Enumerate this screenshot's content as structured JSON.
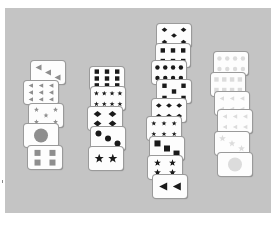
{
  "scene": {
    "description": "Stacks of picture cards with shapes arranged in four columns on a gray surface",
    "background_color": "#c4c4c4"
  },
  "colors": {
    "gray": "#8e8e8e",
    "black": "#1a1a1a",
    "light": "#dcdcdc"
  },
  "columns": [
    {
      "name": "gray-column",
      "cards": [
        {
          "shape": "triangle",
          "count": 3,
          "color": "gray",
          "x": 31,
          "y": 61
        },
        {
          "shape": "triangle",
          "count": 9,
          "color": "gray",
          "x": 24,
          "y": 81
        },
        {
          "shape": "star",
          "count": 5,
          "color": "gray",
          "x": 29,
          "y": 104
        },
        {
          "shape": "circle",
          "count": 1,
          "color": "gray",
          "x": 24,
          "y": 124
        },
        {
          "shape": "square",
          "count": 4,
          "color": "gray",
          "x": 28,
          "y": 146
        }
      ]
    },
    {
      "name": "black-column-left",
      "cards": [
        {
          "shape": "square",
          "count": 9,
          "color": "black",
          "x": 90,
          "y": 67
        },
        {
          "shape": "star",
          "count": 8,
          "color": "black",
          "x": 91,
          "y": 87
        },
        {
          "shape": "diamond",
          "count": 4,
          "color": "black",
          "x": 88,
          "y": 107
        },
        {
          "shape": "circle",
          "count": 3,
          "color": "black",
          "x": 91,
          "y": 127
        },
        {
          "shape": "star",
          "count": 2,
          "color": "black",
          "x": 89,
          "y": 147
        }
      ]
    },
    {
      "name": "black-column-right",
      "cards": [
        {
          "shape": "diamond",
          "count": 5,
          "color": "black",
          "x": 157,
          "y": 24
        },
        {
          "shape": "square",
          "count": 6,
          "color": "black",
          "x": 156,
          "y": 44
        },
        {
          "shape": "circle",
          "count": 8,
          "color": "black",
          "x": 152,
          "y": 61
        },
        {
          "shape": "square",
          "count": 5,
          "color": "black",
          "x": 157,
          "y": 80
        },
        {
          "shape": "diamond",
          "count": 6,
          "color": "black",
          "x": 152,
          "y": 99
        },
        {
          "shape": "star",
          "count": 6,
          "color": "black",
          "x": 147,
          "y": 117
        },
        {
          "shape": "square",
          "count": 3,
          "color": "black",
          "x": 150,
          "y": 137
        },
        {
          "shape": "star",
          "count": 4,
          "color": "black",
          "x": 148,
          "y": 156
        },
        {
          "shape": "triangle",
          "count": 2,
          "color": "black",
          "x": 153,
          "y": 175
        }
      ]
    },
    {
      "name": "light-column",
      "cards": [
        {
          "shape": "circle",
          "count": 8,
          "color": "light",
          "x": 214,
          "y": 52
        },
        {
          "shape": "square",
          "count": 8,
          "color": "light",
          "x": 211,
          "y": 73
        },
        {
          "shape": "triangle",
          "count": 6,
          "color": "light",
          "x": 215,
          "y": 92
        },
        {
          "shape": "triangle",
          "count": 6,
          "color": "light",
          "x": 218,
          "y": 110
        },
        {
          "shape": "star",
          "count": 3,
          "color": "light",
          "x": 215,
          "y": 132
        },
        {
          "shape": "circle",
          "count": 1,
          "color": "light",
          "x": 218,
          "y": 153
        }
      ]
    }
  ]
}
